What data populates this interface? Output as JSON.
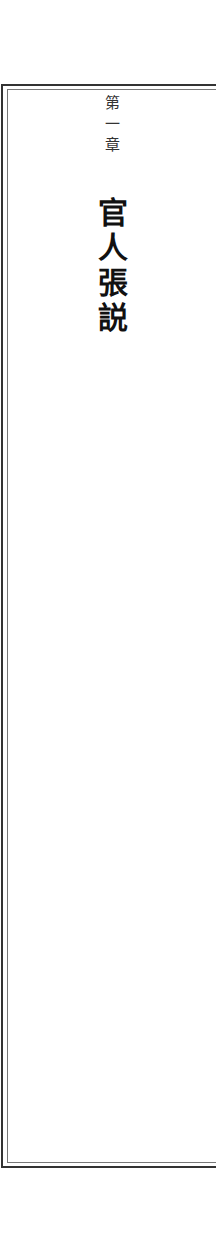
{
  "chapter": {
    "label_chars": [
      "第",
      "一",
      "章"
    ],
    "title_chars": [
      "官",
      "人",
      "張",
      "説"
    ]
  },
  "colors": {
    "background": "#ffffff",
    "border": "#333333",
    "text": "#111111"
  }
}
